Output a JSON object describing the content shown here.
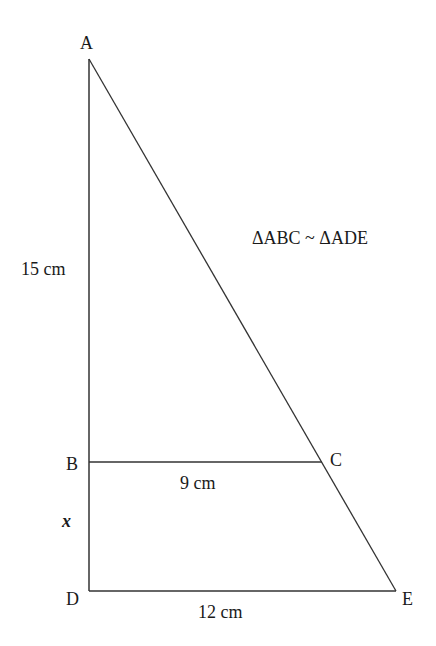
{
  "diagram": {
    "relation": "ΔABC ~ ΔADE",
    "vertices": [
      {
        "name": "A",
        "x": 89,
        "y": 59
      },
      {
        "name": "B",
        "x": 89,
        "y": 462
      },
      {
        "name": "C",
        "x": 322,
        "y": 462
      },
      {
        "name": "D",
        "x": 89,
        "y": 591
      },
      {
        "name": "E",
        "x": 396,
        "y": 591
      }
    ],
    "labels": {
      "A": "A",
      "B": "B",
      "C": "C",
      "D": "D",
      "E": "E"
    },
    "measurements": {
      "AB": "15 cm",
      "BC": "9 cm",
      "BD": "x",
      "DE": "12 cm"
    },
    "segments": [
      {
        "from": "A",
        "to": "D"
      },
      {
        "from": "A",
        "to": "E"
      },
      {
        "from": "B",
        "to": "C"
      },
      {
        "from": "D",
        "to": "E"
      }
    ],
    "line_color": "#333333"
  }
}
